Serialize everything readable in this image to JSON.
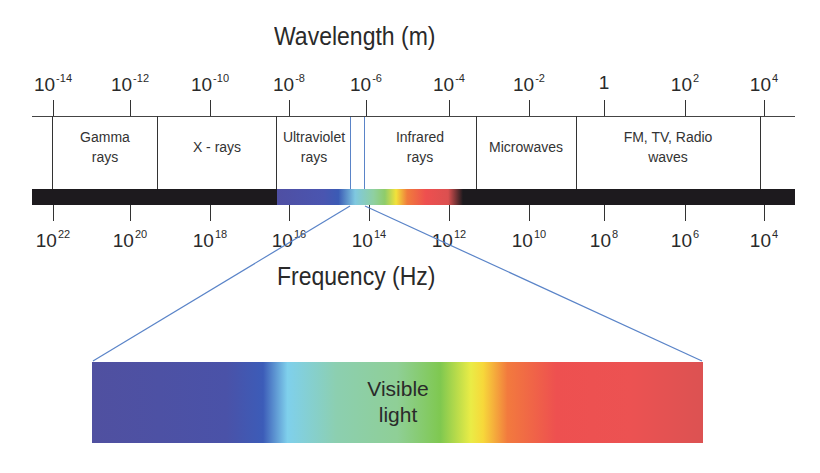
{
  "wavelength_axis": {
    "title": "Wavelength (m)",
    "ticks": [
      {
        "base": "10",
        "exp": "-14",
        "x": 53
      },
      {
        "base": "10",
        "exp": "-12",
        "x": 130
      },
      {
        "base": "10",
        "exp": "-10",
        "x": 210
      },
      {
        "base": "10",
        "exp": "-8",
        "x": 289
      },
      {
        "base": "10",
        "exp": "-6",
        "x": 366
      },
      {
        "base": "10",
        "exp": "-4",
        "x": 449
      },
      {
        "base": "10",
        "exp": "-2",
        "x": 529
      },
      {
        "base": "1",
        "exp": "",
        "x": 604
      },
      {
        "base": "10",
        "exp": "2",
        "x": 685
      },
      {
        "base": "10",
        "exp": "4",
        "x": 764
      }
    ]
  },
  "regions": [
    {
      "line1": "Gamma",
      "line2": "rays",
      "x": 105
    },
    {
      "line1": "X - rays",
      "line2": "",
      "x": 217
    },
    {
      "line1": "Ultraviolet",
      "line2": "rays",
      "x": 314
    },
    {
      "line1": "Infrared",
      "line2": "rays",
      "x": 420
    },
    {
      "line1": "Microwaves",
      "line2": "",
      "x": 526
    },
    {
      "line1": "FM, TV, Radio",
      "line2": "waves",
      "x": 668
    }
  ],
  "frequency_axis": {
    "title": "Frequency (Hz)",
    "ticks": [
      {
        "base": "10",
        "exp": "22",
        "x": 53
      },
      {
        "base": "10",
        "exp": "20",
        "x": 130
      },
      {
        "base": "10",
        "exp": "18",
        "x": 210
      },
      {
        "base": "10",
        "exp": "16",
        "x": 289
      },
      {
        "base": "10",
        "exp": "14",
        "x": 369
      },
      {
        "base": "10",
        "exp": "12",
        "x": 449
      },
      {
        "base": "10",
        "exp": "10",
        "x": 529
      },
      {
        "base": "10",
        "exp": "8",
        "x": 604
      },
      {
        "base": "10",
        "exp": "6",
        "x": 685
      },
      {
        "base": "10",
        "exp": "4",
        "x": 764
      }
    ]
  },
  "visible_light": {
    "line1": "Visible",
    "line2": "light"
  },
  "colors": {
    "band": "#1d1a1e",
    "connector": "#5a84c8",
    "violet": "#4f4fa3",
    "blue": "#3b5bb5",
    "cyan": "#7fc8e0",
    "green": "#8fcc6a",
    "yellow": "#f2e23a",
    "orange": "#f07c3c",
    "red": "#ee4f4f",
    "deep_red": "#db5050"
  }
}
